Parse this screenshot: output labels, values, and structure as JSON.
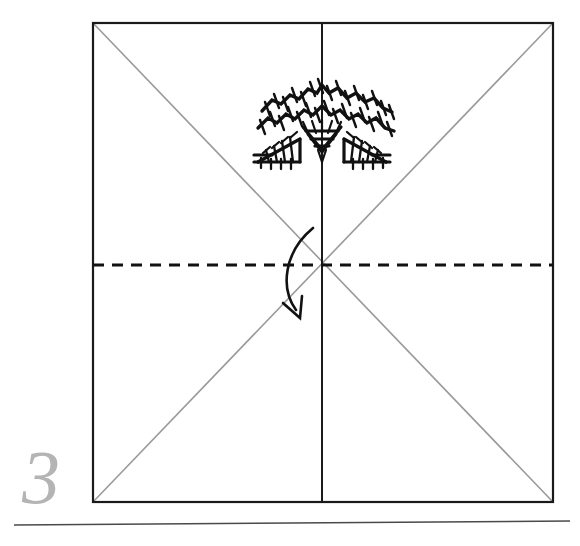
{
  "diagram": {
    "step_number": "3",
    "step_label": "3",
    "caption": "",
    "paper": {
      "shape": "square",
      "left": 93,
      "top": 23,
      "right": 553,
      "bottom": 502,
      "width": 460,
      "height": 479,
      "outline_color": "#1a1a1a",
      "outline_width": 2.2,
      "fill_color": "#ffffff"
    },
    "crease_lines": [
      {
        "name": "diagonal-crease-tl-br",
        "type": "existing-crease",
        "style": "solid",
        "color": "#9a9a9a",
        "width": 1.6,
        "from": [
          93,
          23
        ],
        "to": [
          553,
          502
        ]
      },
      {
        "name": "diagonal-crease-tr-bl",
        "type": "existing-crease",
        "style": "solid",
        "color": "#9a9a9a",
        "width": 1.6,
        "from": [
          553,
          23
        ],
        "to": [
          93,
          502
        ]
      },
      {
        "name": "vertical-center-crease",
        "type": "existing-crease",
        "style": "solid",
        "color": "#1a1a1a",
        "width": 2.0,
        "from": [
          322,
          23
        ],
        "to": [
          322,
          502
        ]
      }
    ],
    "fold_line": {
      "name": "horizontal-valley-fold-line",
      "type": "valley-fold",
      "style": "dashed",
      "color": "#111111",
      "width": 3.0,
      "dash": "11 8",
      "from": [
        93,
        265
      ],
      "to": [
        553,
        265
      ]
    },
    "fold_arrow": {
      "name": "fold-direction-arrow",
      "direction": "fold-top-edge-down",
      "color": "#111111",
      "width": 2.6,
      "curve": "M 313 228 C 284 252, 280 288, 296 310",
      "head": "open-v",
      "head_tip": [
        300,
        318
      ],
      "head_left": [
        283,
        303
      ],
      "head_right": [
        302,
        296
      ]
    },
    "center_point": [
      322,
      265
    ],
    "motif": {
      "name": "decorative-hatched-motif",
      "description": "stylized hatched arch with two wedges and a downward chevron",
      "color": "#111111",
      "bounds": [
        255,
        70,
        145,
        100
      ],
      "parts": [
        "arch-band-upper",
        "arch-band-lower",
        "center-chevron",
        "wedge-left",
        "wedge-right"
      ]
    },
    "footer_rule": {
      "name": "footer-divider",
      "color": "#4a4a4a",
      "width": 1.6,
      "from": [
        14,
        525
      ],
      "to": [
        570,
        521
      ]
    }
  }
}
